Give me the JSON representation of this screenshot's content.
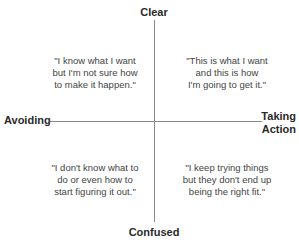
{
  "axes": {
    "top": "Clear",
    "bottom": "Confused",
    "left": "Avoiding",
    "right_line1": "Taking",
    "right_line2": "Action"
  },
  "quadrants": {
    "top_left": [
      "\"I know what I want",
      "but I'm not sure how",
      "to make it happen.\""
    ],
    "top_right": [
      "\"This is what I want",
      "and this is how",
      "I'm going to get it.\""
    ],
    "bottom_left": [
      "\"I don't know what to",
      "do or even how to",
      "start figuring it out.\""
    ],
    "bottom_right": [
      "\"I keep trying things",
      "but they don't end up",
      "being the right fit.\""
    ]
  }
}
